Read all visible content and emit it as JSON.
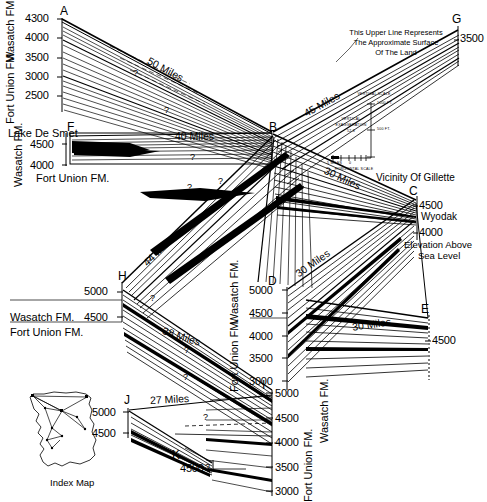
{
  "figure": {
    "type": "geologic-fence-diagram",
    "region": "Powder River Basin, Wyoming",
    "note_upper_line": "This Upper Line Represents\nThe Approximate Surface\nOf The Land",
    "note_line1": "This Upper Line Represents",
    "note_line2": "The Approximate Surface",
    "note_line3": "Of The Land",
    "vicinity_label": "Vicinity Of Gillette",
    "elevation_caption_line1": "Elevation Above",
    "elevation_caption_line2": "Sea Level",
    "wyodak_label": "Wyodak",
    "index_map_caption": "Index Map",
    "lake_de_smet_label": "Lake De Smet"
  },
  "scale_box": {
    "vertical_scale_label": "VERTICAL SCALE",
    "vertical_ticks": [
      "1000 FT.",
      "500 FT.",
      "0"
    ],
    "vertical_exaggeration_line1": "VERTICAL",
    "vertical_exaggeration_line2": "EXAGGERATION",
    "vertical_exaggeration_value": "52.8",
    "horizontal_scale_label": "HORIZONTAL SCALE",
    "horizontal_left": "5 MILES",
    "horizontal_zero": "0"
  },
  "formations": {
    "upper": "Wasatch FM.",
    "lower": "Fort Union FM."
  },
  "panels": [
    {
      "id": "A",
      "label": "A",
      "ticks": [
        "4300",
        "4000",
        "3500",
        "3000",
        "2500"
      ],
      "formation_upper": "Wasatch FM.",
      "formation_lower": "Fort Union FM."
    },
    {
      "id": "F",
      "label": "F",
      "ticks": [
        "4500",
        "4000"
      ],
      "formation_upper": "Wasatch FM.",
      "formation_lower": "Fort Union FM."
    },
    {
      "id": "B",
      "label": "B",
      "ticks": [],
      "formation_upper": "",
      "formation_lower": ""
    },
    {
      "id": "G",
      "label": "G",
      "ticks": [
        "3500"
      ],
      "formation_upper": "",
      "formation_lower": ""
    },
    {
      "id": "C",
      "label": "C",
      "ticks": [
        "4500",
        "4000"
      ],
      "formation_upper": "",
      "formation_lower": ""
    },
    {
      "id": "D",
      "label": "D",
      "ticks": [
        "5000",
        "4500",
        "4000",
        "3500",
        "3000"
      ],
      "formation_upper": "Wasatch FM.",
      "formation_lower": "Fort Union FM."
    },
    {
      "id": "E",
      "label": "E",
      "ticks": [
        "4500"
      ],
      "formation_upper": "",
      "formation_lower": ""
    },
    {
      "id": "H",
      "label": "H",
      "ticks": [
        "5000",
        "4500"
      ],
      "formation_upper": "Wasatch FM.",
      "formation_lower": "Fort Union FM."
    },
    {
      "id": "I",
      "label": "I",
      "ticks": [
        "5000",
        "4500",
        "4000",
        "3500",
        "3000"
      ],
      "formation_upper": "Wasatch FM.",
      "formation_lower": "Fort Union FM."
    },
    {
      "id": "J",
      "label": "J",
      "ticks": [
        "5000",
        "4500"
      ],
      "formation_upper": "",
      "formation_lower": ""
    },
    {
      "id": "K",
      "label": "K",
      "ticks": [
        "4500"
      ],
      "formation_upper": "",
      "formation_lower": ""
    }
  ],
  "distances": [
    {
      "id": "A-B",
      "label": "50 Miles"
    },
    {
      "id": "F-B",
      "label": "40 Miles"
    },
    {
      "id": "B-G",
      "label": "45 Miles"
    },
    {
      "id": "B-C",
      "label": "30 Miles"
    },
    {
      "id": "B-H",
      "label": "44 Miles"
    },
    {
      "id": "C-D",
      "label": "30 Miles"
    },
    {
      "id": "C-E",
      "label": "30 Miles"
    },
    {
      "id": "H-I",
      "label": "38 Miles"
    },
    {
      "id": "J-I",
      "label": "27 Miles"
    }
  ],
  "query_marks": [
    "?",
    "?",
    "?",
    "?",
    "?",
    "?",
    "?",
    "?",
    "?",
    "?",
    "?",
    "?"
  ],
  "coal_beds": [
    "ANDERSON",
    "CANYON",
    "COOK",
    "WALL",
    "PAWNEE",
    "CACHE",
    "UPPER PAWNEE",
    "SCOTT",
    "FELIX",
    "ROLAND",
    "SMITH",
    "WALTERS",
    "HEALY",
    "DE SMET",
    "MONARCH",
    "CARNEY",
    "MURPHY",
    "GATES",
    "KENNEDY",
    "DIETZ",
    "MASTERS",
    "SCHOOLS",
    "DURHAM",
    "WYODAK",
    "MONARCH 3",
    "VERONA",
    "CROFT",
    "LAKE",
    "UPPER"
  ],
  "index_map": {
    "caption": "Index Map",
    "points": [
      "A",
      "F",
      "B",
      "G",
      "C",
      "D",
      "E",
      "H",
      "I",
      "J",
      "K"
    ]
  },
  "colors": {
    "ink": "#000000",
    "paper": "#ffffff"
  }
}
